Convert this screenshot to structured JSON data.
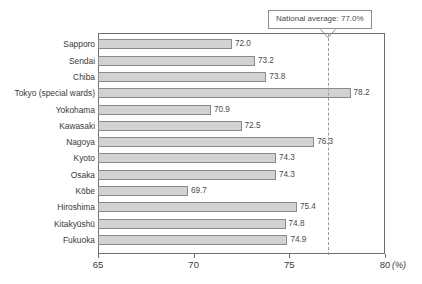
{
  "chart_data": {
    "type": "bar",
    "orientation": "horizontal",
    "title": "",
    "xlabel": "(%)",
    "ylabel": "",
    "xlim": [
      65,
      80
    ],
    "xticks": [
      "65",
      "70",
      "75",
      "80"
    ],
    "grid": false,
    "legend": null,
    "categories": [
      "Sapporo",
      "Sendai",
      "Chiba",
      "Tokyo (special wards)",
      "Yokohama",
      "Kawasaki",
      "Nagoya",
      "Kyoto",
      "Osaka",
      "Kōbe",
      "Hiroshima",
      "Kitakyūshū",
      "Fukuoka"
    ],
    "values": [
      72.0,
      73.2,
      73.8,
      78.2,
      70.9,
      72.5,
      76.3,
      74.3,
      74.3,
      69.7,
      75.4,
      74.8,
      74.9
    ],
    "value_labels": [
      "72.0",
      "73.2",
      "73.8",
      "78.2",
      "70.9",
      "72.5",
      "76.3",
      "74.3",
      "74.3",
      "69.7",
      "75.4",
      "74.8",
      "74.9"
    ],
    "annotations": [
      {
        "name": "national-average",
        "text": "National average: 77.0%",
        "value": 77.0,
        "style": "dashed-vertical-line-with-callout"
      }
    ],
    "colors": {
      "bar_fill": "#d2d2d2",
      "bar_border": "#8a8a8a",
      "frame": "#6e6e6e",
      "average_line": "#9a9a9a",
      "text": "#3a3a3a"
    }
  },
  "axis": {
    "unit_label": "(%)",
    "ticks": [
      {
        "label": "65",
        "value": 65
      },
      {
        "label": "70",
        "value": 70
      },
      {
        "label": "75",
        "value": 75
      },
      {
        "label": "80",
        "value": 80
      }
    ]
  },
  "callout": {
    "text": "National average: 77.0%"
  }
}
